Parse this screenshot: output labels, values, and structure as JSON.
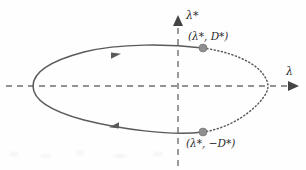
{
  "figure": {
    "background_color": "#fefefe",
    "curve_color": "#5a5a5a",
    "axis_color": "#707070",
    "marker_color": "#8a8a8a",
    "text_color": "#2b2b2b"
  },
  "axes": {
    "horizontal": {
      "label": "λ",
      "style": "dashed",
      "arrow": "right",
      "y_px": 86,
      "x_start_px": 6,
      "x_end_px": 298
    },
    "vertical": {
      "label": "λ*",
      "style": "dashed",
      "arrow": "up",
      "x_px": 178,
      "y_start_px": 166,
      "y_end_px": 16
    },
    "origin_px": [
      178,
      86
    ]
  },
  "chart_data": {
    "type": "line",
    "title": "",
    "xlabel": "λ",
    "ylabel": "λ*",
    "grid": false,
    "legend": null,
    "annotations": [
      {
        "name": "upper-point",
        "text": "(λ*, D*)",
        "point_px": [
          203,
          48
        ],
        "label_px": [
          188,
          31
        ]
      },
      {
        "name": "lower-point",
        "text": "(λ*, −D*)",
        "point_px": [
          203,
          132
        ],
        "label_px": [
          186,
          138
        ]
      }
    ],
    "series": [
      {
        "name": "homoclinic-loop-solid",
        "style": "solid",
        "description": "Left solid branch of the closed loop running from the upper marked point counter-clockwise around the left lobe to the lower marked point.",
        "path": "M 203 48 C 170 44, 120 43, 84 52 C 50 61, 33 73, 33 86 C 33 99, 50 111, 84 120 C 120 129, 170 136, 203 132"
      },
      {
        "name": "homoclinic-loop-dotted",
        "style": "dotted",
        "description": "Right dotted branch of the loop closing from the upper marked point through the cusp on the lambda axis down to the lower marked point.",
        "path": "M 203 48 C 232 52, 254 62, 263 74 C 266 78, 268 82, 268 86 C 268 90, 266 94, 263 98 C 254 110, 232 128, 203 132"
      }
    ],
    "direction_arrows": [
      {
        "name": "upper-flow-arrow",
        "at_px": [
          115,
          56
        ],
        "direction": "right"
      },
      {
        "name": "lower-flow-arrow",
        "at_px": [
          115,
          125
        ],
        "direction": "left"
      }
    ],
    "cusp_px": [
      268,
      86
    ]
  }
}
